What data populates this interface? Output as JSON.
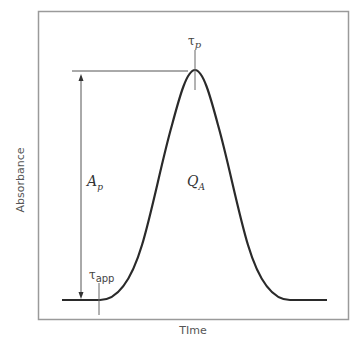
{
  "diagram": {
    "type": "chromatographic peak schematic",
    "axes": {
      "xlabel": "TIme",
      "ylabel": "Absorbance"
    },
    "labels": {
      "peak_height": {
        "main": "A",
        "sub": "p"
      },
      "peak_area": {
        "main": "Q",
        "sub": "A"
      },
      "peak_time": {
        "main": "τ",
        "sub": "p"
      },
      "appearance_time": {
        "main": "τ",
        "sub": "app"
      }
    },
    "colors": {
      "curve": "#2a2a2a",
      "frame": "#9a9a9a",
      "annotation": "#555555",
      "text": "#555555"
    }
  }
}
